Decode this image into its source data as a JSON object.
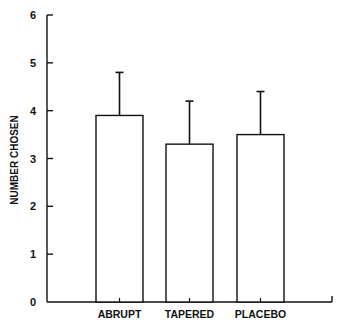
{
  "chart_data": {
    "type": "bar",
    "title": "",
    "xlabel": "",
    "ylabel": "NUMBER CHOSEN",
    "categories": [
      "ABRUPT",
      "TAPERED",
      "PLACEBO"
    ],
    "values": [
      3.9,
      3.3,
      3.5
    ],
    "error_upper": [
      0.9,
      0.9,
      0.9
    ],
    "error_top_values": [
      4.8,
      4.2,
      4.4
    ],
    "ylim": [
      0,
      6
    ],
    "yticks": [
      0,
      1,
      2,
      3,
      4,
      5,
      6
    ],
    "ytick_labels": [
      "0",
      "1",
      "2",
      "3",
      "4",
      "5",
      "6"
    ],
    "grid": false,
    "legend": null,
    "bar_fill": "#ffffff",
    "line_color": "#111111"
  }
}
